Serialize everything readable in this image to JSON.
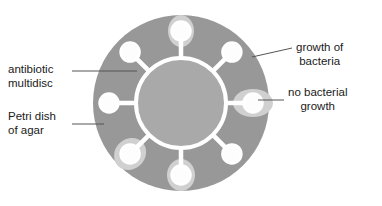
{
  "figure": {
    "width": 382,
    "height": 206
  },
  "colors": {
    "background": "#ffffff",
    "agar": "#989898",
    "multidisc_fill": "#a9a9a9",
    "multidisc_outline": "#ffffff",
    "disc_fill": "#fdfdfd",
    "inhibition_zone": "#d0d0d0",
    "leader_line": "#555555",
    "text": "#1a1a1a"
  },
  "labels": {
    "antibiotic_multidisc": {
      "line1": "antibiotic",
      "line2": "multidisc"
    },
    "petri_dish": {
      "line1": "Petri dish",
      "line2": "of agar"
    },
    "growth_of_bacteria": {
      "line1": "growth of",
      "line2": "bacteria"
    },
    "no_bacterial_growth": {
      "line1": "no bacterial",
      "line2": "growth"
    }
  },
  "diagram": {
    "dish": {
      "cx": 181,
      "cy": 103,
      "r": 88
    },
    "multidisc_ring": {
      "cx": 181,
      "cy": 103,
      "r": 45,
      "stroke_width": 4
    },
    "arm_length": 27,
    "disc_radius": 9.5,
    "discs": [
      {
        "name": "disc-top",
        "angle_deg": 270,
        "inhibition_zone": true,
        "zone_rx": 16,
        "zone_ry": 13
      },
      {
        "name": "disc-upper-right",
        "angle_deg": 315,
        "inhibition_zone": false,
        "zone_rx": 0,
        "zone_ry": 0
      },
      {
        "name": "disc-right",
        "angle_deg": 0,
        "inhibition_zone": true,
        "zone_rx": 20,
        "zone_ry": 14
      },
      {
        "name": "disc-lower-right",
        "angle_deg": 45,
        "inhibition_zone": false,
        "zone_rx": 0,
        "zone_ry": 0
      },
      {
        "name": "disc-bottom",
        "angle_deg": 90,
        "inhibition_zone": true,
        "zone_rx": 16,
        "zone_ry": 14
      },
      {
        "name": "disc-lower-left",
        "angle_deg": 135,
        "inhibition_zone": true,
        "zone_rx": 17,
        "zone_ry": 15
      },
      {
        "name": "disc-left",
        "angle_deg": 180,
        "inhibition_zone": false,
        "zone_rx": 0,
        "zone_ry": 0
      },
      {
        "name": "disc-upper-left",
        "angle_deg": 225,
        "inhibition_zone": false,
        "zone_rx": 0,
        "zone_ry": 0
      }
    ],
    "leader_lines": [
      {
        "name": "leader-antibiotic-multidisc",
        "x1": 72,
        "y1": 71,
        "x2": 137,
        "y2": 71
      },
      {
        "name": "leader-petri-dish",
        "x1": 72,
        "y1": 124,
        "x2": 104,
        "y2": 124
      },
      {
        "name": "leader-growth-of-bacteria",
        "x1": 252,
        "y1": 57,
        "x2": 292,
        "y2": 48
      },
      {
        "name": "leader-no-bacterial-growth",
        "x1": 258,
        "y1": 100,
        "x2": 284,
        "y2": 100
      }
    ]
  }
}
